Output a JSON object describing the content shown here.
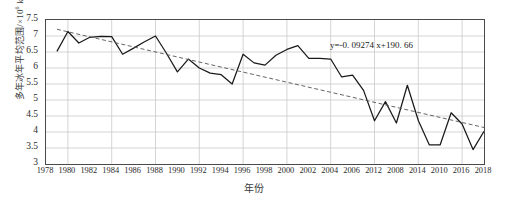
{
  "chart_data": {
    "type": "line",
    "title": "",
    "xlabel": "年份",
    "ylabel": "多年冰年平均范围/×10⁶ km²",
    "ylabel_main": "多年冰年平均范围/×10",
    "ylabel_exp": "6",
    "ylabel_unit": " km",
    "ylabel_unit_exp": "2",
    "xlim": [
      1978,
      2018
    ],
    "ylim": [
      3,
      7.5
    ],
    "grid": true,
    "legend": null,
    "yticks": [
      7.5,
      7,
      6.5,
      6,
      5.5,
      5,
      4.5,
      4,
      3.5,
      3
    ],
    "xticks": [
      1978,
      1980,
      1982,
      1984,
      1986,
      1988,
      1990,
      1992,
      1994,
      1996,
      1998,
      2000,
      2002,
      2004,
      2006,
      2012,
      2008,
      2014,
      2010,
      2016,
      2018
    ],
    "annotation": "y=-0. 09274 x+190. 66",
    "annotation_slope": -0.09274,
    "annotation_intercept": 190.66,
    "series": [
      {
        "name": "多年冰年平均范围",
        "style": "solid",
        "color": "#1a1a1a",
        "x": [
          1979,
          1980,
          1981,
          1982,
          1983,
          1984,
          1985,
          1986,
          1987,
          1988,
          1989,
          1990,
          1991,
          1992,
          1993,
          1994,
          1995,
          1996,
          1997,
          1998,
          1999,
          2000,
          2001,
          2002,
          2003,
          2004,
          2005,
          2006,
          2007,
          2008,
          2009,
          2010,
          2011,
          2012,
          2013,
          2014,
          2015,
          2016,
          2017,
          2018
        ],
        "values": [
          6.52,
          7.14,
          6.78,
          6.96,
          6.99,
          6.98,
          6.43,
          6.62,
          6.82,
          7.0,
          6.46,
          5.88,
          6.28,
          6.0,
          5.84,
          5.79,
          5.5,
          6.43,
          6.16,
          6.09,
          6.4,
          6.58,
          6.7,
          6.3,
          6.3,
          6.28,
          5.72,
          5.78,
          5.3,
          4.35,
          4.95,
          4.28,
          5.46,
          4.36,
          3.6,
          3.6,
          4.6,
          4.25,
          3.45,
          4.02
        ]
      },
      {
        "name": "线性趋势线",
        "style": "dashed",
        "color": "#555555",
        "x": [
          1979,
          2018
        ],
        "values": [
          7.21,
          4.14
        ]
      }
    ]
  }
}
